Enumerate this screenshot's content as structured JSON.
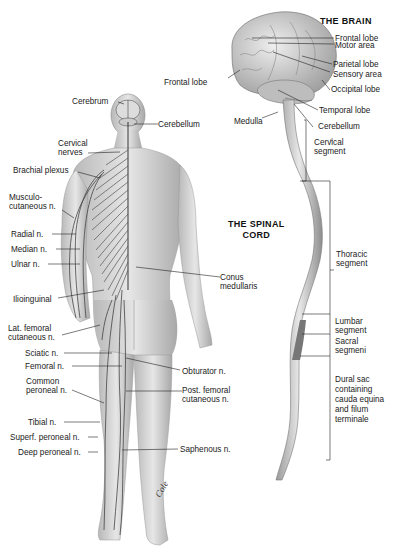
{
  "titles": {
    "brain": "THE BRAIN",
    "spinal_cord": "THE SPINAL\nCORD"
  },
  "brain_labels": {
    "frontal_lobe_top": "Frontal lobe",
    "motor_area": "Motor area",
    "parietal_lobe": "Parietal lobe",
    "sensory_area": "Sensory area",
    "occipital_lobe": "Occipital lobe",
    "frontal_lobe_left": "Frontal lobe",
    "temporal_lobe": "Temporal lobe",
    "medulla": "Medulla",
    "cerebellum": "Cerebellum"
  },
  "cord_labels": {
    "cervical": "Cervical\nsegment",
    "thoracic": "Thoracic\nsegment",
    "lumbar": "Lumbar\nsegment",
    "sacral": "Sacral\nsegmeni",
    "dural": "Dural sac\ncontaining\ncauda equina\nand filum\nterminale"
  },
  "body_labels": {
    "cerebrum": "Cerebrum",
    "cerebellum": "Cerebellum",
    "cervical_nerves": "Cervical\nnerves",
    "brachial_plexus": "Brachial plexus",
    "musculocutaneous": "Musculo-\ncutaneous n.",
    "radial": "Radial n.",
    "median": "Median n.",
    "ulnar": "Ulnar n.",
    "conus": "Conus\nmedullaris",
    "ilioinguinal": "Ilioinguinal",
    "lat_femoral": "Lat. femoral\ncutaneous n.",
    "sciatic": "Sciatic n.",
    "femoral": "Femoral n.",
    "obturator": "Obturator n.",
    "common_peroneal": "Common\nperoneal n.",
    "post_femoral": "Post. femoral\ncutaneous n.",
    "tibial": "Tibial n.",
    "superf_peroneal": "Superf. peroneal n.",
    "deep_peroneal": "Deep peroneal n.",
    "saphenous": "Saphenous n."
  },
  "signature": "Cole"
}
